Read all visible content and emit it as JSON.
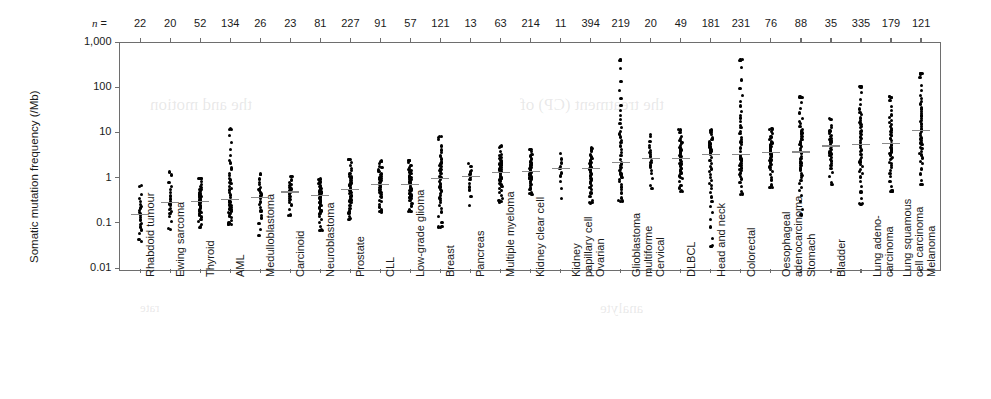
{
  "figure": {
    "n_prefix": "n =",
    "y_axis_title": "Somatic mutation frequency (/Mb)"
  },
  "chart_data": {
    "type": "scatter",
    "title": "",
    "xlabel": "",
    "ylabel": "Somatic mutation frequency (/Mb)",
    "yscale": "log",
    "ylim": [
      0.01,
      1000
    ],
    "ytick_labels": [
      "1,000",
      "100",
      "10",
      "1",
      "0.1",
      "0.01"
    ],
    "ytick_values": [
      1000,
      100,
      10,
      1,
      0.1,
      0.01
    ],
    "grid": false,
    "legend": "none",
    "annotation_row_label": "n =",
    "categories": [
      "Rhabdoid tumour",
      "Ewing sarcoma",
      "Thyroid",
      "AML",
      "Medulloblastoma",
      "Carcinoid",
      "Neuroblastoma",
      "Prostate",
      "CLL",
      "Low-grade glioma",
      "Breast",
      "Pancreas",
      "Multiple myeloma",
      "Kidney clear cell",
      "Kidney papillary cell",
      "Ovarian",
      "Glioblastoma multiforme",
      "Cervical",
      "DLBCL",
      "Head and neck",
      "Colorectal",
      "Oesophageal adenocarcinoma",
      "Stomach",
      "Bladder",
      "Lung adenocarcinoma",
      "Lung squamous cell carcinoma",
      "Melanoma"
    ],
    "category_label_lines": [
      [
        "Rhabdoid tumour"
      ],
      [
        "Ewing sarcoma"
      ],
      [
        "Thyroid"
      ],
      [
        "AML"
      ],
      [
        "Medulloblastoma"
      ],
      [
        "Carcinoid"
      ],
      [
        "Neuroblastoma"
      ],
      [
        "Prostate"
      ],
      [
        "CLL"
      ],
      [
        "Low-grade glioma"
      ],
      [
        "Breast"
      ],
      [
        "Pancreas"
      ],
      [
        "Multiple myeloma"
      ],
      [
        "Kidney clear cell"
      ],
      [
        "Kidney",
        "papillary cell"
      ],
      [
        "Ovarian"
      ],
      [
        "Glioblastoma",
        "multiforme"
      ],
      [
        "Cervical"
      ],
      [
        "DLBCL"
      ],
      [
        "Head and neck"
      ],
      [
        "Colorectal"
      ],
      [
        "Oesophageal",
        "adenocarcinoma"
      ],
      [
        "Stomach"
      ],
      [
        "Bladder"
      ],
      [
        "Lung adeno-",
        "carcinoma"
      ],
      [
        "Lung squamous",
        "cell carcinoma"
      ],
      [
        "Melanoma"
      ]
    ],
    "n_values": [
      22,
      20,
      52,
      134,
      26,
      23,
      81,
      227,
      91,
      57,
      121,
      13,
      63,
      214,
      11,
      394,
      219,
      20,
      49,
      181,
      231,
      76,
      88,
      35,
      335,
      179,
      121
    ],
    "medians": [
      0.15,
      0.28,
      0.3,
      0.33,
      0.36,
      0.48,
      0.4,
      0.55,
      0.7,
      0.7,
      0.95,
      1.05,
      1.3,
      1.35,
      1.6,
      1.6,
      2.2,
      2.6,
      2.6,
      3.2,
      3.3,
      3.6,
      3.7,
      5.0,
      5.5,
      5.6,
      11.0
    ],
    "min_values": [
      0.04,
      0.07,
      0.08,
      0.09,
      0.05,
      0.15,
      0.07,
      0.12,
      0.17,
      0.18,
      0.08,
      0.25,
      0.3,
      0.43,
      0.33,
      0.28,
      0.3,
      0.6,
      0.5,
      0.03,
      0.42,
      0.6,
      0.15,
      0.7,
      0.26,
      0.5,
      0.7
    ],
    "max_values": [
      0.65,
      1.3,
      1.0,
      12.0,
      1.2,
      1.1,
      0.9,
      2.5,
      2.3,
      2.4,
      8.0,
      2.1,
      5.0,
      4.2,
      3.3,
      4.5,
      400.0,
      9.0,
      11.0,
      11.0,
      400.0,
      12.0,
      60.0,
      20.0,
      100.0,
      60.0,
      200.0
    ],
    "y_pixel_map": {
      "1000": 42,
      "100": 87,
      "10": 134,
      "1": 181,
      "0.1": 228,
      "0.01": 268
    },
    "units": "mutations per megabase"
  },
  "ghost_text": [
    {
      "text": "the and motion",
      "x": 150,
      "y": 95,
      "size": 17
    },
    {
      "text": "the treatment (CP) of",
      "x": 520,
      "y": 95,
      "size": 17
    },
    {
      "text": "analyte",
      "x": 600,
      "y": 300,
      "size": 15
    },
    {
      "text": "rate",
      "x": 140,
      "y": 300,
      "size": 13
    }
  ]
}
